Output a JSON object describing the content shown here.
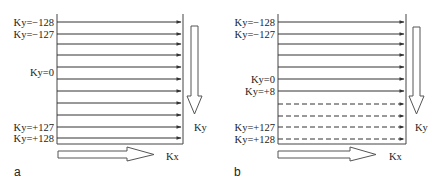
{
  "figure": {
    "panels": [
      {
        "id": "a",
        "letter": "a",
        "box": {
          "x1": 57,
          "x2": 183,
          "y1": 14,
          "y2": 144
        },
        "lines": [
          {
            "y": 22,
            "style": "solid"
          },
          {
            "y": 34,
            "style": "solid"
          },
          {
            "y": 44,
            "style": "solid"
          },
          {
            "y": 55,
            "style": "solid"
          },
          {
            "y": 67,
            "style": "solid"
          },
          {
            "y": 79,
            "style": "solid"
          },
          {
            "y": 91,
            "style": "solid"
          },
          {
            "y": 103,
            "style": "solid"
          },
          {
            "y": 115,
            "style": "solid"
          },
          {
            "y": 127,
            "style": "solid"
          },
          {
            "y": 138,
            "style": "solid"
          }
        ],
        "row_labels": [
          {
            "text": "Ky=−128",
            "y": 22
          },
          {
            "text": "Ky=−127",
            "y": 34
          },
          {
            "text": "Ky=0",
            "y": 72
          },
          {
            "text": "Ky=+127",
            "y": 127
          },
          {
            "text": "Ky=+128",
            "y": 138
          }
        ],
        "ky_arrow_label": "Ky",
        "kx_arrow_label": "Kx"
      },
      {
        "id": "b",
        "letter": "b",
        "box": {
          "x1": 278,
          "x2": 406,
          "y1": 14,
          "y2": 144
        },
        "lines": [
          {
            "y": 22,
            "style": "solid"
          },
          {
            "y": 34,
            "style": "solid"
          },
          {
            "y": 44,
            "style": "solid"
          },
          {
            "y": 55,
            "style": "solid"
          },
          {
            "y": 67,
            "style": "solid"
          },
          {
            "y": 79,
            "style": "solid"
          },
          {
            "y": 91,
            "style": "solid"
          },
          {
            "y": 104,
            "style": "dashed"
          },
          {
            "y": 116,
            "style": "dashed"
          },
          {
            "y": 127,
            "style": "dashed"
          },
          {
            "y": 139,
            "style": "dashed"
          }
        ],
        "row_labels": [
          {
            "text": "Ky=−128",
            "y": 22
          },
          {
            "text": "Ky=−127",
            "y": 34
          },
          {
            "text": "Ky=0",
            "y": 79
          },
          {
            "text": "Ky=+8",
            "y": 91
          },
          {
            "text": "Ky=+127",
            "y": 127
          },
          {
            "text": "Ky=+128",
            "y": 139
          }
        ],
        "ky_arrow_label": "Ky",
        "kx_arrow_label": "Kx"
      }
    ],
    "colors": {
      "line": "#333333",
      "arrow_outline": "#555555",
      "text": "#222222"
    }
  }
}
